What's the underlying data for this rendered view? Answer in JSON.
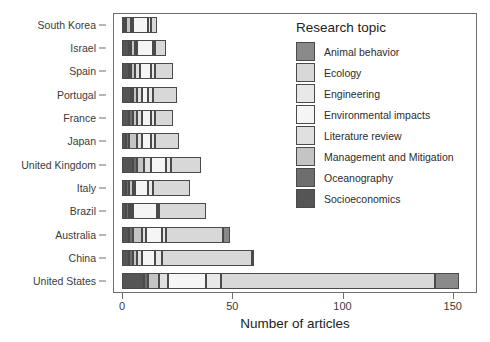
{
  "chart_data": {
    "type": "bar",
    "orientation": "horizontal",
    "stacked": true,
    "title": "",
    "xlabel": "Number of articles",
    "ylabel": "",
    "xlim": [
      0,
      160
    ],
    "ylim": null,
    "grid": false,
    "legend_position": "inside-top-right",
    "legend_title": "Research topic",
    "xticks": [
      0,
      50,
      100,
      150
    ],
    "xtick_labels": [
      "0",
      "50",
      "100",
      "150"
    ],
    "categories": [
      "South Korea",
      "Israel",
      "Spain",
      "Portugal",
      "France",
      "Japan",
      "United Kingdom",
      "Italy",
      "Brazil",
      "Australia",
      "China",
      "United States"
    ],
    "series": [
      {
        "name": "Socioeconomics",
        "color": "#555555",
        "values": [
          1,
          3,
          3,
          4,
          3,
          2,
          5,
          2,
          2,
          3,
          3,
          10
        ]
      },
      {
        "name": "Oceanography",
        "color": "#6e6e6e",
        "values": [
          1,
          1,
          1,
          1,
          2,
          1,
          2,
          1,
          1,
          2,
          2,
          2
        ]
      },
      {
        "name": "Management and Mitigation",
        "color": "#c4c4c4",
        "values": [
          2,
          2,
          2,
          2,
          2,
          4,
          3,
          2,
          1,
          4,
          2,
          5
        ]
      },
      {
        "name": "Literature review",
        "color": "#e0e0e0",
        "values": [
          1,
          1,
          2,
          2,
          2,
          2,
          3,
          1,
          1,
          2,
          2,
          4
        ]
      },
      {
        "name": "Environmental impacts",
        "color": "#f5f5f5",
        "values": [
          7,
          7,
          5,
          3,
          4,
          4,
          7,
          6,
          11,
          7,
          6,
          17
        ]
      },
      {
        "name": "Engineering",
        "color": "#e8e8e8",
        "values": [
          1,
          1,
          2,
          2,
          2,
          2,
          2,
          2,
          1,
          2,
          3,
          7
        ]
      },
      {
        "name": "Ecology",
        "color": "#d8d8d8",
        "values": [
          3,
          5,
          8,
          11,
          8,
          11,
          14,
          17,
          21,
          26,
          41,
          97
        ]
      },
      {
        "name": "Animal behavior",
        "color": "#8a8a8a",
        "values": [
          0,
          0,
          0,
          0,
          0,
          0,
          0,
          0,
          0,
          3,
          1,
          11
        ]
      }
    ],
    "totals": [
      16,
      20,
      23,
      25,
      23,
      26,
      36,
      31,
      38,
      49,
      60,
      153
    ],
    "legend_entries": [
      {
        "label": "Animal behavior",
        "color": "#8a8a8a"
      },
      {
        "label": "Ecology",
        "color": "#d8d8d8"
      },
      {
        "label": "Engineering",
        "color": "#e8e8e8"
      },
      {
        "label": "Environmental impacts",
        "color": "#f5f5f5"
      },
      {
        "label": "Literature review",
        "color": "#e0e0e0"
      },
      {
        "label": "Management and Mitigation",
        "color": "#c4c4c4"
      },
      {
        "label": "Oceanography",
        "color": "#6e6e6e"
      },
      {
        "label": "Socioeconomics",
        "color": "#555555"
      }
    ]
  }
}
